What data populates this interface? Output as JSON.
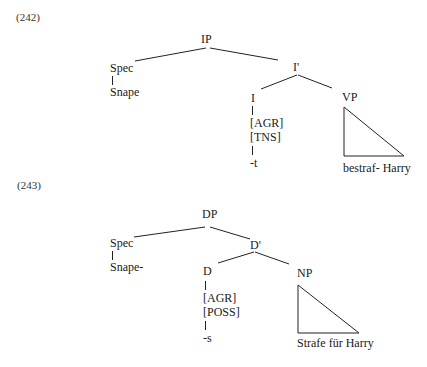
{
  "examples": [
    {
      "number": "(242)",
      "tree": {
        "root": "IP",
        "spec": {
          "label": "Spec",
          "word": "Snape"
        },
        "bar": "I'",
        "head": {
          "label": "I",
          "features": [
            "[AGR]",
            "[TNS]"
          ],
          "morpheme": "-t"
        },
        "complement": {
          "label": "VP",
          "content": "bestraf- Harry"
        }
      }
    },
    {
      "number": "(243)",
      "tree": {
        "root": "DP",
        "spec": {
          "label": "Spec",
          "word": "Snape-"
        },
        "bar": "D'",
        "head": {
          "label": "D",
          "features": [
            "[AGR]",
            "[POSS]"
          ],
          "morpheme": "-s"
        },
        "complement": {
          "label": "NP",
          "content": "Strafe für Harry"
        }
      }
    }
  ]
}
